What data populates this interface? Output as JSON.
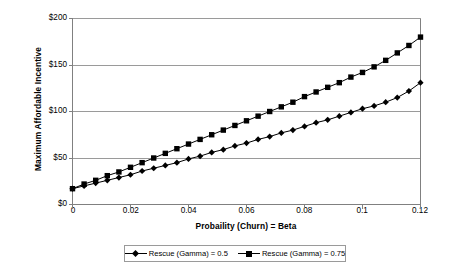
{
  "chart_data": {
    "type": "line",
    "title": "",
    "xlabel": "Probaility (Churn) = Beta",
    "ylabel": "Maximum Affordable Incentive",
    "xlim": [
      0,
      0.12
    ],
    "ylim": [
      0,
      200
    ],
    "grid": "horizontal",
    "legend_position": "bottom",
    "x_ticks": [
      "0",
      "0.02",
      "0.04",
      "0.06",
      "0.08",
      "0.1",
      "0.12"
    ],
    "x_tick_values": [
      0,
      0.02,
      0.04,
      0.06,
      0.08,
      0.1,
      0.12
    ],
    "y_ticks": [
      "$0",
      "$50",
      "$100",
      "$150",
      "$200"
    ],
    "y_tick_values": [
      0,
      50,
      100,
      150,
      200
    ],
    "x": [
      0,
      0.004,
      0.008,
      0.012,
      0.016,
      0.02,
      0.024,
      0.028,
      0.032,
      0.036,
      0.04,
      0.044,
      0.048,
      0.052,
      0.056,
      0.06,
      0.064,
      0.068,
      0.072,
      0.076,
      0.08,
      0.084,
      0.088,
      0.092,
      0.096,
      0.1,
      0.104,
      0.108,
      0.112,
      0.116,
      0.12
    ],
    "series": [
      {
        "name": "Rescue (Gamma) = 0.5",
        "marker": "diamond",
        "color": "#000000",
        "values": [
          17,
          20,
          23,
          26,
          29,
          32,
          36,
          39,
          42,
          45,
          49,
          52,
          56,
          59,
          63,
          66,
          70,
          73,
          77,
          80,
          84,
          88,
          91,
          95,
          99,
          103,
          106,
          110,
          115,
          122,
          131
        ]
      },
      {
        "name": "Rescue (Gamma) = 0.75",
        "marker": "square",
        "color": "#000000",
        "values": [
          17,
          22,
          26,
          31,
          35,
          40,
          45,
          50,
          55,
          60,
          65,
          70,
          75,
          80,
          85,
          90,
          95,
          100,
          105,
          110,
          116,
          121,
          126,
          131,
          137,
          142,
          148,
          155,
          163,
          171,
          180
        ]
      }
    ],
    "legend": [
      {
        "label": "Rescue (Gamma) = 0.5",
        "marker": "diamond"
      },
      {
        "label": "Rescue (Gamma) = 0.75",
        "marker": "square"
      }
    ],
    "axis_color": "#808080",
    "grid_color": "#9a9a9a",
    "plot_background": "#ffffff"
  }
}
